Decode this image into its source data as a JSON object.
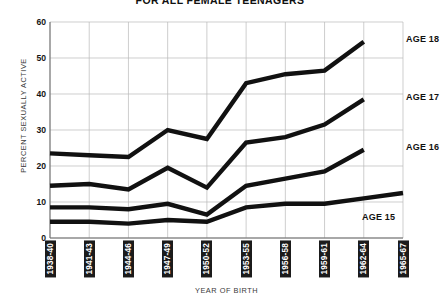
{
  "chart_data": {
    "type": "line",
    "title": "FOR ALL FEMALE TEENAGERS",
    "xlabel": "YEAR OF BIRTH",
    "ylabel": "PERCENT SEXUALLY ACTIVE",
    "categories": [
      "1938-40",
      "1941-43",
      "1944-46",
      "1947-49",
      "1950-52",
      "1953-55",
      "1956-58",
      "1959-61",
      "1962-64",
      "1965-67"
    ],
    "ylim": [
      0,
      60
    ],
    "yticks": [
      0,
      10,
      20,
      30,
      40,
      50,
      60
    ],
    "grid": true,
    "legend_position": "right-inline",
    "series": [
      {
        "name": "AGE 18",
        "values": [
          23.5,
          23.0,
          22.5,
          30.0,
          27.5,
          43.0,
          45.5,
          46.5,
          54.5,
          null
        ]
      },
      {
        "name": "AGE 17",
        "values": [
          14.5,
          15.0,
          13.5,
          19.5,
          14.0,
          26.5,
          28.0,
          31.5,
          38.5,
          null
        ]
      },
      {
        "name": "AGE 16",
        "values": [
          8.5,
          8.5,
          8.0,
          9.5,
          6.5,
          14.5,
          16.5,
          18.5,
          24.5,
          null
        ]
      },
      {
        "name": "AGE 15",
        "values": [
          4.5,
          4.5,
          4.0,
          5.0,
          4.5,
          8.5,
          9.5,
          9.5,
          11.0,
          12.5
        ]
      }
    ],
    "series_label_positions": [
      {
        "name": "AGE 18",
        "x": 406,
        "y": 34
      },
      {
        "name": "AGE 17",
        "x": 406,
        "y": 92
      },
      {
        "name": "AGE 16",
        "x": 406,
        "y": 142
      },
      {
        "name": "AGE 15",
        "x": 362,
        "y": 212
      }
    ]
  }
}
